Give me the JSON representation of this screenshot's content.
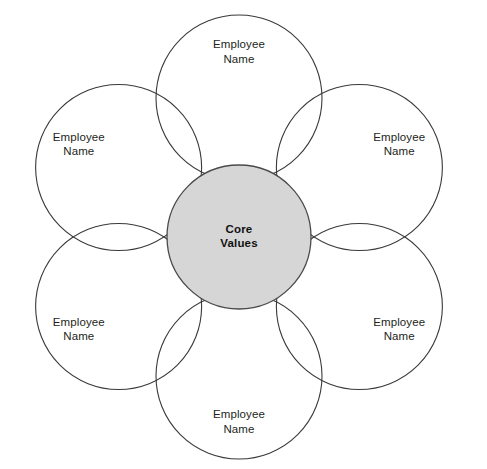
{
  "diagram": {
    "type": "petal-venn",
    "canvas": {
      "width": 487,
      "height": 469,
      "background": "#ffffff"
    },
    "center": {
      "name": "core-values",
      "line1": "Core",
      "line2": "Values",
      "cx": 239,
      "cy": 237,
      "r": 72,
      "fill": "#d6d6d6",
      "stroke": "#4a4a4a"
    },
    "petal": {
      "r": 83,
      "orbit": 139,
      "stroke": "#3a3a3a",
      "fill": "none",
      "label_offset": 46
    },
    "petals": [
      {
        "name": "petal-top",
        "angle_deg": -90,
        "line1": "Employee",
        "line2": "Name"
      },
      {
        "name": "petal-upper-right",
        "angle_deg": -30,
        "line1": "Employee",
        "line2": "Name"
      },
      {
        "name": "petal-lower-right",
        "angle_deg": 30,
        "line1": "Employee",
        "line2": "Name"
      },
      {
        "name": "petal-bottom",
        "angle_deg": 90,
        "line1": "Employee",
        "line2": "Name"
      },
      {
        "name": "petal-lower-left",
        "angle_deg": 150,
        "line1": "Employee",
        "line2": "Name"
      },
      {
        "name": "petal-upper-left",
        "angle_deg": 210,
        "line1": "Employee",
        "line2": "Name"
      }
    ]
  }
}
